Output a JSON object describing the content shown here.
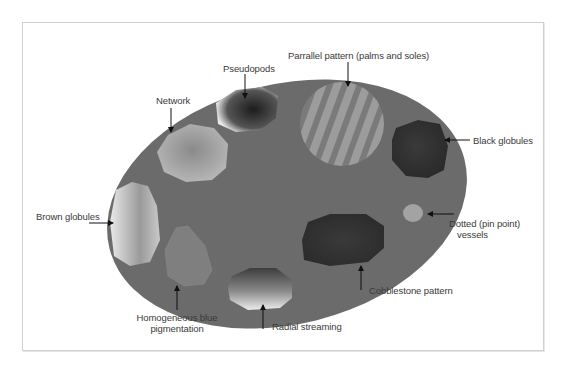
{
  "figure": {
    "type": "diagram",
    "colors": {
      "ellipse_fill": "#6b6b6b",
      "frame_border": "#cfcfcf",
      "label_text": "#3a3a3a",
      "arrow": "#111111"
    },
    "labels": {
      "pseudopods": "Pseudopods",
      "parallel_pattern": "Parrallel pattern (palms and soles)",
      "network": "Network",
      "black_globules": "Black globules",
      "brown_globules": "Brown globules",
      "dotted_vessels_line1": "Dotted (pin point)",
      "dotted_vessels_line2": "vessels",
      "cobblestone": "Cobblestone pattern",
      "homogeneous_line1": "Homogeneous blue",
      "homogeneous_line2": "pigmentation",
      "radial_streaming": "Radial streaming"
    }
  }
}
